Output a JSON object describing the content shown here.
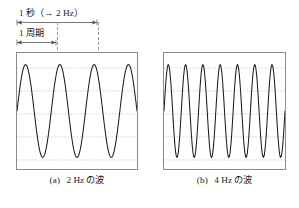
{
  "annotations": {
    "second_label": "1 秒（→ 2 Hz）",
    "period_label": "1 周期"
  },
  "captions": {
    "a_tag": "(a)",
    "a_text": "2 Hz の波",
    "b_tag": "(b)",
    "b_text": "4 Hz の波"
  },
  "figure_caption": "",
  "colors": {
    "wave_stroke": "#1a1a1a",
    "box_border": "#8b8b8b",
    "gridline": "#b9bfcf",
    "guide_dash": "#9a9a9a",
    "arrow": "#555555"
  },
  "chart_data": [
    {
      "type": "line",
      "id": "wave-a",
      "title": "2 Hz の波",
      "xlabel": "",
      "ylabel": "",
      "frequency_hz": 2,
      "amplitude": 1,
      "cycles_shown": 3.5,
      "time_span_s": 1.75,
      "xlim": [
        0,
        1.75
      ],
      "ylim": [
        -1.25,
        1.25
      ],
      "grid": true,
      "gridlines_y": [
        -1,
        -0.5,
        0,
        0.5,
        1
      ],
      "phase_rad": 0,
      "legend": "none",
      "annotations": [
        {
          "label": "1 周期",
          "x_start": 0,
          "x_end": 0.5
        },
        {
          "label": "1 秒（→ 2 Hz）",
          "x_start": 0,
          "x_end": 1.0
        }
      ],
      "x": [
        0,
        0.0875,
        0.175,
        0.2625,
        0.35,
        0.4375,
        0.525,
        0.6125,
        0.7,
        0.7875,
        0.875,
        0.9625,
        1.05,
        1.1375,
        1.225,
        1.3125,
        1.4,
        1.4875,
        1.575,
        1.6625,
        1.75
      ],
      "values": [
        0,
        0.891,
        0.951,
        0.156,
        -0.809,
        -1.0,
        -0.309,
        0.707,
        1.0,
        0.454,
        -0.588,
        -0.988,
        -0.588,
        0.454,
        1.0,
        0.707,
        -0.309,
        -1.0,
        -0.809,
        0.156,
        0.951
      ]
    },
    {
      "type": "line",
      "id": "wave-b",
      "title": "4 Hz の波",
      "xlabel": "",
      "ylabel": "",
      "frequency_hz": 4,
      "amplitude": 1,
      "cycles_shown": 7,
      "time_span_s": 1.75,
      "xlim": [
        0,
        1.75
      ],
      "ylim": [
        -1.25,
        1.25
      ],
      "grid": true,
      "gridlines_y": [
        -1,
        -0.5,
        0,
        0.5,
        1
      ],
      "phase_rad": 0,
      "legend": "none",
      "annotations": [],
      "x": [
        0,
        0.0875,
        0.175,
        0.2625,
        0.35,
        0.4375,
        0.525,
        0.6125,
        0.7,
        0.7875,
        0.875,
        0.9625,
        1.05,
        1.1375,
        1.225,
        1.3125,
        1.4,
        1.4875,
        1.575,
        1.6625,
        1.75
      ],
      "values": [
        0,
        0.951,
        -0.588,
        -0.309,
        1.0,
        -0.809,
        0.0,
        0.809,
        -1.0,
        0.309,
        0.588,
        -0.951,
        0.0,
        0.951,
        -0.588,
        -0.309,
        1.0,
        -0.809,
        0.0,
        0.809,
        -1.0
      ]
    }
  ]
}
